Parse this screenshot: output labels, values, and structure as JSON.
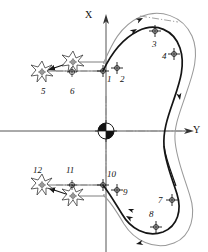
{
  "figure": {
    "background": "#ffffff",
    "stroke_color": "#1a1a1a",
    "light_stroke_color": "#7d7d7d",
    "width": 208,
    "height": 252
  },
  "axes": {
    "x_label": "X",
    "y_label": "Y",
    "x_axis_name": "vertical-axis",
    "y_axis_name": "horizontal-axis",
    "origin": {
      "label": "",
      "marker": "quadrant-pie-marker",
      "x": 106,
      "y": 131,
      "radius": 8,
      "filled_quadrants": "top-left,bottom-right"
    }
  },
  "point_labels": [
    {
      "id": "1",
      "text": "1",
      "x": 107,
      "y": 79,
      "marker_x": 103,
      "marker_y": 71
    },
    {
      "id": "2",
      "text": "2",
      "x": 120,
      "y": 79,
      "marker_x": 117,
      "marker_y": 68
    },
    {
      "id": "3",
      "text": "3",
      "x": 152,
      "y": 44,
      "marker_x": 155,
      "marker_y": 31
    },
    {
      "id": "4",
      "text": "4",
      "x": 162,
      "y": 57,
      "marker_x": 174,
      "marker_y": 54
    },
    {
      "id": "5",
      "text": "5",
      "x": 43,
      "y": 92,
      "marker_x": 42,
      "marker_y": 72
    },
    {
      "id": "6",
      "text": "6",
      "x": 71,
      "y": 92,
      "marker_x": 72,
      "marker_y": 72
    },
    {
      "id": "7",
      "text": "7",
      "x": 158,
      "y": 201,
      "marker_x": 172,
      "marker_y": 200
    },
    {
      "id": "8",
      "text": "8",
      "x": 151,
      "y": 215,
      "marker_x": 156,
      "marker_y": 227
    },
    {
      "id": "9",
      "text": "9",
      "x": 123,
      "y": 194,
      "marker_x": 117,
      "marker_y": 190
    },
    {
      "id": "10",
      "text": "10",
      "x": 108,
      "y": 177,
      "marker_x": 103,
      "marker_y": 185
    },
    {
      "id": "11",
      "text": "11",
      "x": 68,
      "y": 172,
      "marker_x": 71,
      "marker_y": 185
    },
    {
      "id": "12",
      "text": "12",
      "x": 36,
      "y": 172,
      "marker_x": 42,
      "marker_y": 185
    }
  ],
  "burst_markers": [
    {
      "name": "burst-marker-5",
      "cx": 42,
      "cy": 72,
      "r": 10
    },
    {
      "name": "burst-marker-6",
      "cx": 73,
      "cy": 62,
      "r": 10
    },
    {
      "name": "burst-marker-12",
      "cx": 42,
      "cy": 185,
      "r": 10
    },
    {
      "name": "burst-marker-11",
      "cx": 73,
      "cy": 196,
      "r": 10
    }
  ],
  "crosshair_markers": [
    {
      "name": "crosshair-1",
      "cx": 103,
      "cy": 71
    },
    {
      "name": "crosshair-2",
      "cx": 117,
      "cy": 68
    },
    {
      "name": "crosshair-3",
      "cx": 155,
      "cy": 31
    },
    {
      "name": "crosshair-4",
      "cx": 174,
      "cy": 54
    },
    {
      "name": "crosshair-7",
      "cx": 172,
      "cy": 200
    },
    {
      "name": "crosshair-8",
      "cx": 156,
      "cy": 227
    },
    {
      "name": "crosshair-9",
      "cx": 117,
      "cy": 190
    },
    {
      "name": "crosshair-10",
      "cx": 103,
      "cy": 185
    },
    {
      "name": "crosshair-6",
      "cx": 72,
      "cy": 72
    },
    {
      "name": "crosshair-11",
      "cx": 72,
      "cy": 185
    }
  ],
  "flow_arrows": [
    {
      "name": "flow-arrow-upper-outer",
      "x": 138,
      "y": 20,
      "angle": 28
    },
    {
      "name": "flow-arrow-upper-inner",
      "x": 136,
      "y": 26,
      "angle": 33
    },
    {
      "name": "flow-arrow-right-down",
      "x": 181,
      "y": 96,
      "angle": 100
    },
    {
      "name": "flow-arrow-lower-outer",
      "x": 140,
      "y": 246,
      "angle": 160
    },
    {
      "name": "flow-arrow-lower-left",
      "x": 128,
      "y": 213,
      "angle": 205
    },
    {
      "name": "flow-arrow-to-burst-5",
      "x": 54,
      "y": 70,
      "angle": 195
    },
    {
      "name": "flow-arrow-to-burst-12",
      "x": 54,
      "y": 190,
      "angle": 195
    }
  ],
  "paths": {
    "main_contour_name": "main-contour-path",
    "offset_contour_name": "offset-contour-path",
    "lead_lines_name": "lead-in-lines",
    "centerlines_name": "center-dash-dot-lines"
  }
}
